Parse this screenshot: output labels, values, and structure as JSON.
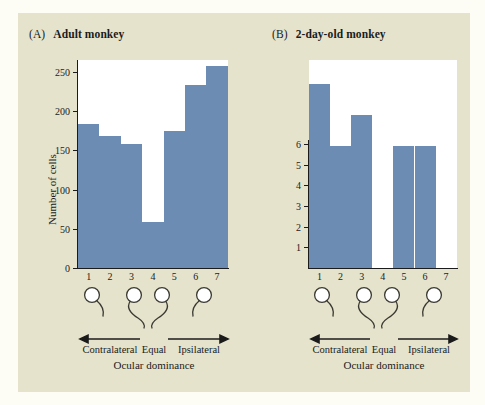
{
  "figure": {
    "background_color": "#e5e3cc",
    "outer_color": "#fdfdf6",
    "bar_color": "#6d8cb4",
    "axis_color": "#1b1b1b"
  },
  "panels": [
    {
      "tag": "(A)",
      "name": "Adult monkey",
      "ylabel": "Number of cells",
      "yticks": [
        "0",
        "50",
        "100",
        "150",
        "200",
        "250"
      ],
      "xticks": [
        "1",
        "2",
        "3",
        "4",
        "5",
        "6",
        "7"
      ],
      "dominance_labels": {
        "left": "Contralateral",
        "center": "Equal",
        "right": "Ipsilateral"
      },
      "axis_caption": "Ocular dominance"
    },
    {
      "tag": "(B)",
      "name": "2-day-old monkey",
      "ylabel": "",
      "yticks": [
        "1",
        "2",
        "3",
        "4",
        "5",
        "6"
      ],
      "xticks": [
        "1",
        "2",
        "3",
        "4",
        "5",
        "6",
        "7"
      ],
      "dominance_labels": {
        "left": "Contralateral",
        "center": "Equal",
        "right": "Ipsilateral"
      },
      "axis_caption": "Ocular dominance"
    }
  ],
  "chart_data": [
    {
      "type": "bar",
      "title": "(A) Adult monkey",
      "categories": [
        "1",
        "2",
        "3",
        "4",
        "5",
        "6",
        "7"
      ],
      "values": [
        184,
        168,
        158,
        59,
        175,
        233,
        257
      ],
      "xlabel": "Ocular dominance",
      "ylabel": "Number of cells",
      "ylim": [
        0,
        265
      ],
      "yticks": [
        0,
        50,
        100,
        150,
        200,
        250
      ],
      "grid": false,
      "legend": false
    },
    {
      "type": "bar",
      "title": "(B) 2-day-old monkey",
      "categories": [
        "1",
        "2",
        "3",
        "4",
        "5",
        "6",
        "7"
      ],
      "values": [
        6,
        4,
        5,
        0,
        4,
        4,
        0
      ],
      "xlabel": "Ocular dominance",
      "ylabel": "",
      "ylim": [
        0,
        6.8
      ],
      "yticks": [
        1,
        2,
        3,
        4,
        5,
        6
      ],
      "grid": false,
      "legend": false
    }
  ]
}
